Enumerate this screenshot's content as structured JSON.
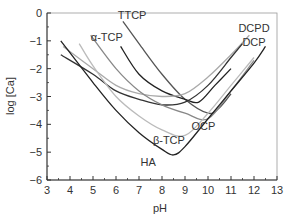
{
  "chart_data": {
    "type": "line",
    "title": "",
    "xlabel": "pH",
    "ylabel": "log [Ca]",
    "xlim": [
      3,
      13
    ],
    "ylim": [
      -6,
      0
    ],
    "xticks": [
      "3",
      "4",
      "5",
      "6",
      "7",
      "8",
      "9",
      "10",
      "11",
      "12",
      "13"
    ],
    "yticks": [
      "0",
      "-1",
      "-2",
      "-3",
      "-4",
      "-5",
      "-6"
    ],
    "grid": false,
    "legend": "inline labels",
    "series": [
      {
        "name": "TTCP",
        "color": "#555555",
        "points": [
          [
            6.3,
            -0.3
          ],
          [
            7,
            -1.1
          ],
          [
            8,
            -2.2
          ],
          [
            9,
            -3.1
          ],
          [
            10,
            -3.6
          ],
          [
            10.5,
            -3.4
          ],
          [
            11,
            -2.9
          ]
        ]
      },
      {
        "name": "α-TCP",
        "color": "#222222",
        "points": [
          [
            6.2,
            -1.2
          ],
          [
            7,
            -2.2
          ],
          [
            8,
            -2.8
          ],
          [
            9,
            -3.1
          ],
          [
            9.6,
            -3.2
          ],
          [
            10.3,
            -2.6
          ],
          [
            11,
            -2.0
          ]
        ]
      },
      {
        "name": "DCPD",
        "color": "#aaaaaa",
        "points": [
          [
            3.7,
            -1.2
          ],
          [
            5,
            -2.0
          ],
          [
            6,
            -2.6
          ],
          [
            7,
            -2.9
          ],
          [
            8,
            -3.0
          ],
          [
            9,
            -2.9
          ],
          [
            10,
            -2.3
          ],
          [
            11,
            -1.5
          ],
          [
            11.8,
            -0.8
          ]
        ]
      },
      {
        "name": "DCP",
        "color": "#333333",
        "points": [
          [
            3.6,
            -1.5
          ],
          [
            5,
            -2.2
          ],
          [
            6,
            -2.8
          ],
          [
            7,
            -3.1
          ],
          [
            8,
            -3.3
          ],
          [
            9,
            -3.2
          ],
          [
            10,
            -2.6
          ],
          [
            11,
            -1.6
          ],
          [
            11.5,
            -1.1
          ]
        ]
      },
      {
        "name": "OCP",
        "color": "#888888",
        "points": [
          [
            4.9,
            -0.8
          ],
          [
            6,
            -2.0
          ],
          [
            7,
            -2.8
          ],
          [
            8,
            -3.3
          ],
          [
            9,
            -3.6
          ],
          [
            10,
            -3.8
          ],
          [
            11,
            -2.8
          ],
          [
            12,
            -1.7
          ]
        ]
      },
      {
        "name": "β-TCP",
        "color": "#bbbbbb",
        "points": [
          [
            4.4,
            -1.1
          ],
          [
            5,
            -1.9
          ],
          [
            6,
            -3.0
          ],
          [
            7,
            -3.7
          ],
          [
            8,
            -4.2
          ],
          [
            9,
            -4.4
          ],
          [
            10,
            -3.6
          ],
          [
            11,
            -2.6
          ],
          [
            12,
            -1.6
          ]
        ]
      },
      {
        "name": "HA",
        "color": "#222222",
        "points": [
          [
            3.6,
            -1.0
          ],
          [
            5,
            -2.5
          ],
          [
            6,
            -3.5
          ],
          [
            7,
            -4.3
          ],
          [
            8,
            -4.9
          ],
          [
            8.5,
            -5.1
          ],
          [
            9,
            -4.8
          ],
          [
            10,
            -3.8
          ],
          [
            11,
            -2.8
          ],
          [
            12,
            -1.8
          ],
          [
            12.5,
            -1.2
          ]
        ]
      }
    ],
    "annotations": [
      {
        "text": "TTCP",
        "x": 6.7,
        "y": -0.2
      },
      {
        "text": "α-TCP",
        "x": 5.6,
        "y": -1.0
      },
      {
        "text": "DCPD",
        "x": 12.0,
        "y": -0.7
      },
      {
        "text": "DCP",
        "x": 12.0,
        "y": -1.2
      },
      {
        "text": "OCP",
        "x": 9.8,
        "y": -4.2
      },
      {
        "text": "β-TCP",
        "x": 8.3,
        "y": -4.7
      },
      {
        "text": "HA",
        "x": 7.4,
        "y": -5.5
      }
    ]
  }
}
